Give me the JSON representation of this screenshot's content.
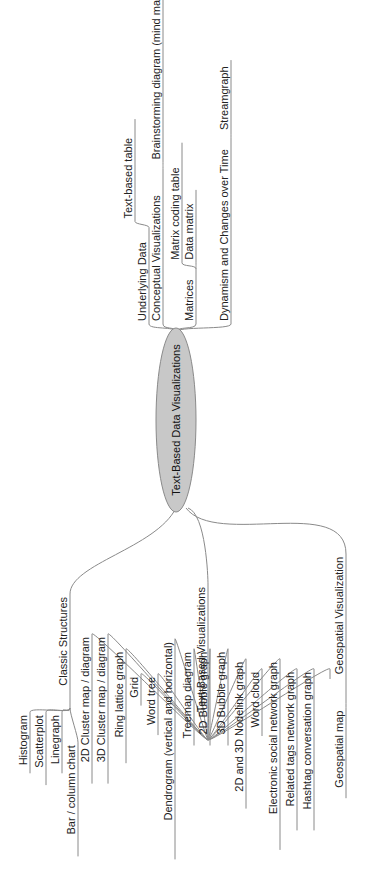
{
  "diagram": {
    "type": "mind-map",
    "orientation": "rotated-90-ccw",
    "center": {
      "label": "Text-Based Data Visualizations",
      "fill": "#c8c8c8"
    },
    "right_branches": [
      {
        "label": "Underlying Data",
        "children": [
          {
            "label": "Text-based table"
          }
        ]
      },
      {
        "label": "Conceptual Visualizations",
        "children": [
          {
            "label": "Brainstorming diagram (mind map / concept map)"
          }
        ]
      },
      {
        "label": "Matrices",
        "children": [
          {
            "label": "Matrix coding table"
          },
          {
            "label": "Data matrix"
          }
        ]
      },
      {
        "label": "Dynamism and Changes over Time",
        "children": [
          {
            "label": "Streamgraph"
          }
        ]
      }
    ],
    "left_branches": [
      {
        "label": "Classic Structures",
        "children": [
          {
            "label": "Histogram"
          },
          {
            "label": "Scatterplot"
          },
          {
            "label": "Linegraph"
          },
          {
            "label": "Bar / column chart"
          }
        ]
      },
      {
        "label": "Text-Based Visualizations",
        "children": [
          {
            "label": "2D Cluster map / diagram"
          },
          {
            "label": "3D Cluster map / diagram"
          },
          {
            "label": "Ring lattice graph"
          },
          {
            "label": "Grid"
          },
          {
            "label": "Word tree"
          },
          {
            "label": "Dendrogram (vertical and horizontal)"
          },
          {
            "label": "Treemap diagram"
          },
          {
            "label": "2D Bubble graph"
          },
          {
            "label": "3D Bubble graph"
          },
          {
            "label": "2D and 3D Nodelink graph"
          },
          {
            "label": "Word cloud"
          },
          {
            "label": "Electronic social network graph"
          },
          {
            "label": "Related tags network graph"
          },
          {
            "label": "Hashtag conversation graph"
          },
          {
            "label": ""
          }
        ]
      },
      {
        "label": "Geospatial Visualization",
        "children": [
          {
            "label": "Geospatial map"
          }
        ]
      }
    ]
  }
}
